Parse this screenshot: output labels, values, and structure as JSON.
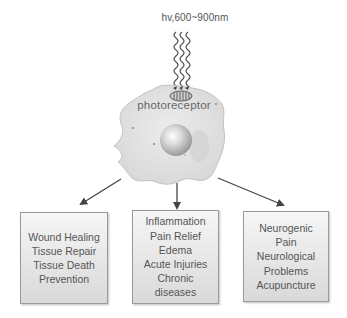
{
  "diagram": {
    "light_label": "hv,600~900nm",
    "light_icon": "wavy-light-rays-icon",
    "cell": {
      "label": "photoreceptor",
      "icon": "cell-icon",
      "organelle_icon": "mitochondrion-icon",
      "nucleus_icon": "nucleus-icon"
    },
    "arrows": [
      {
        "from": "cell",
        "to": "box_left"
      },
      {
        "from": "cell",
        "to": "box_middle"
      },
      {
        "from": "cell",
        "to": "box_right"
      }
    ],
    "boxes": [
      {
        "id": "left",
        "lines": [
          "Wound Healing",
          "Tissue Repair",
          "Tissue Death",
          "Prevention"
        ]
      },
      {
        "id": "middle",
        "lines": [
          "Inflammation",
          "Pain Relief",
          "Edema",
          "Acute Injuries",
          "Chronic",
          "diseases"
        ]
      },
      {
        "id": "right",
        "lines": [
          "Neurogenic",
          "Pain",
          "Neurological",
          "Problems",
          "Acupuncture"
        ]
      }
    ],
    "colors": {
      "arrow": "#444444",
      "box_border": "#9a9a9a",
      "box_fill_top": "#f6f6f6",
      "box_fill_bottom": "#d9d9d9",
      "text": "#555555",
      "cell_fill": "#e4e4e4"
    }
  }
}
